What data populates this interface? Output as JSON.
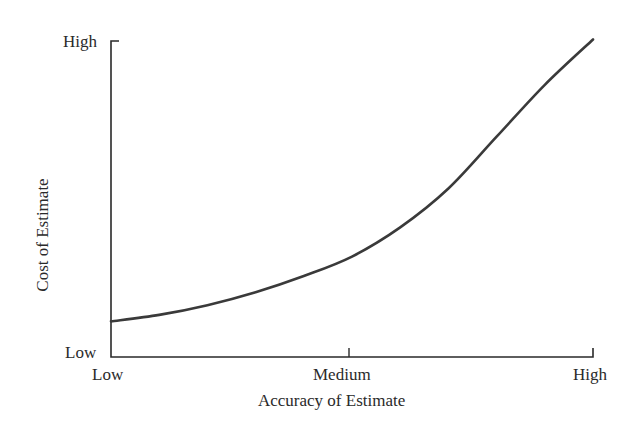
{
  "chart_data": {
    "type": "line",
    "title": "",
    "xlabel": "Accuracy of Estimate",
    "ylabel": "Cost of Estimate",
    "x_tick_labels": [
      "Low",
      "Medium",
      "High"
    ],
    "y_tick_labels": [
      "Low",
      "High"
    ],
    "grid": false,
    "legend": null,
    "xlim": [
      0,
      1
    ],
    "ylim": [
      0,
      1
    ],
    "series": [
      {
        "name": "Cost vs Accuracy",
        "x": [
          0.0,
          0.1,
          0.2,
          0.3,
          0.4,
          0.5,
          0.6,
          0.7,
          0.8,
          0.9,
          1.0
        ],
        "values": [
          0.11,
          0.13,
          0.16,
          0.2,
          0.25,
          0.31,
          0.4,
          0.52,
          0.68,
          0.84,
          0.98
        ]
      }
    ],
    "colors": {
      "curve": "#3a3a3a",
      "axis": "#2a2a2a"
    }
  },
  "labels": {
    "y_high": "High",
    "y_low": "Low",
    "x_low": "Low",
    "x_medium": "Medium",
    "x_high": "High",
    "x_title": "Accuracy of Estimate",
    "y_title": "Cost of Estimate"
  }
}
